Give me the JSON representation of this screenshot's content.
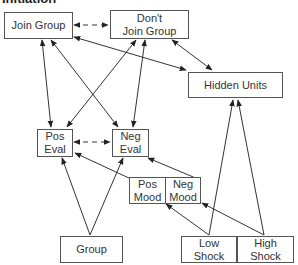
{
  "title": "Initiation",
  "nodes": {
    "join_group": {
      "line1": "Join Group"
    },
    "dont_join_group": {
      "line1": "Don't",
      "line2": "Join Group"
    },
    "hidden_units": {
      "line1": "Hidden Units"
    },
    "pos_eval": {
      "line1": "Pos",
      "line2": "Eval"
    },
    "neg_eval": {
      "line1": "Neg",
      "line2": "Eval"
    },
    "pos_mood": {
      "line1": "Pos",
      "line2": "Mood"
    },
    "neg_mood": {
      "line1": "Neg",
      "line2": "Mood"
    },
    "group": {
      "line1": "Group"
    },
    "low_shock": {
      "line1": "Low",
      "line2": "Shock"
    },
    "high_shock": {
      "line1": "High",
      "line2": "Shock"
    }
  },
  "edges": [
    {
      "from": "Join Group",
      "to": "Don't Join Group",
      "style": "dashed",
      "direction": "both"
    },
    {
      "from": "Join Group",
      "to": "Hidden Units",
      "style": "solid",
      "direction": "both"
    },
    {
      "from": "Don't Join Group",
      "to": "Hidden Units",
      "style": "solid",
      "direction": "both"
    },
    {
      "from": "Join Group",
      "to": "Pos Eval",
      "style": "solid",
      "direction": "both"
    },
    {
      "from": "Join Group",
      "to": "Neg Eval",
      "style": "solid",
      "direction": "both"
    },
    {
      "from": "Don't Join Group",
      "to": "Pos Eval",
      "style": "solid",
      "direction": "both"
    },
    {
      "from": "Don't Join Group",
      "to": "Neg Eval",
      "style": "solid",
      "direction": "both"
    },
    {
      "from": "Pos Eval",
      "to": "Neg Eval",
      "style": "dashed",
      "direction": "both"
    },
    {
      "from": "Group",
      "to": "Pos Eval",
      "style": "solid",
      "direction": "forward"
    },
    {
      "from": "Group",
      "to": "Neg Eval",
      "style": "solid",
      "direction": "forward"
    },
    {
      "from": "Pos Mood",
      "to": "Pos Eval",
      "style": "solid",
      "direction": "forward"
    },
    {
      "from": "Neg Mood",
      "to": "Neg Eval",
      "style": "solid",
      "direction": "forward"
    },
    {
      "from": "Low Shock",
      "to": "Pos Mood",
      "style": "solid",
      "direction": "forward"
    },
    {
      "from": "High Shock",
      "to": "Neg Mood",
      "style": "solid",
      "direction": "forward"
    },
    {
      "from": "Low Shock",
      "to": "Hidden Units",
      "style": "solid",
      "direction": "forward"
    },
    {
      "from": "High Shock",
      "to": "Hidden Units",
      "style": "solid",
      "direction": "forward"
    }
  ]
}
